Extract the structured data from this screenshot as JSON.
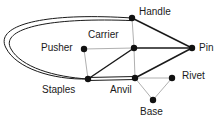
{
  "diagram": {
    "type": "node-link-graph",
    "width": 223,
    "height": 126,
    "background_color": "#ffffff",
    "edge_colors": {
      "strong": "#1a1a1a",
      "weak": "#b0b0b0"
    },
    "node_color": "#111111",
    "node_radius": 3.2,
    "nodes": [
      {
        "id": "handle",
        "label": "Handle",
        "x": 132,
        "y": 18,
        "label_x": 139,
        "label_y": 6,
        "label_anchor": "left"
      },
      {
        "id": "pusher",
        "label": "Pusher",
        "x": 84,
        "y": 49,
        "label_x": 41,
        "label_y": 42,
        "label_anchor": "left"
      },
      {
        "id": "carrier",
        "label": "Carrier",
        "x": 134,
        "y": 48,
        "label_x": 88,
        "label_y": 29,
        "label_anchor": "left"
      },
      {
        "id": "pin",
        "label": "Pin",
        "x": 192,
        "y": 48,
        "label_x": 199,
        "label_y": 42,
        "label_anchor": "left"
      },
      {
        "id": "staples",
        "label": "Staples",
        "x": 88,
        "y": 79,
        "label_x": 42,
        "label_y": 84,
        "label_anchor": "left"
      },
      {
        "id": "anvil",
        "label": "Anvil",
        "x": 135,
        "y": 78,
        "label_x": 110,
        "label_y": 84,
        "label_anchor": "left"
      },
      {
        "id": "rivet",
        "label": "Rivet",
        "x": 172,
        "y": 78,
        "label_x": 182,
        "label_y": 70,
        "label_anchor": "left"
      },
      {
        "id": "base",
        "label": "Base",
        "x": 153,
        "y": 100,
        "label_x": 140,
        "label_y": 106,
        "label_anchor": "left"
      }
    ],
    "edges": [
      {
        "id": "handle-pin",
        "from": "handle",
        "to": "pin",
        "style": "strong",
        "shape": "line"
      },
      {
        "id": "carrier-pin",
        "from": "carrier",
        "to": "pin",
        "style": "strong",
        "shape": "line"
      },
      {
        "id": "anvil-pin",
        "from": "anvil",
        "to": "pin",
        "style": "strong",
        "shape": "line"
      },
      {
        "id": "staples-carrier",
        "from": "staples",
        "to": "carrier",
        "style": "strong",
        "shape": "line"
      },
      {
        "id": "staples-anvil",
        "from": "staples",
        "to": "anvil",
        "style": "strong",
        "shape": "double-line"
      },
      {
        "id": "handle-staples",
        "from": "handle",
        "to": "staples",
        "style": "strong",
        "shape": "double-curve"
      },
      {
        "id": "handle-carrier",
        "from": "handle",
        "to": "carrier",
        "style": "weak",
        "shape": "line"
      },
      {
        "id": "pusher-carrier",
        "from": "pusher",
        "to": "carrier",
        "style": "weak",
        "shape": "line"
      },
      {
        "id": "pusher-staples",
        "from": "pusher",
        "to": "staples",
        "style": "weak",
        "shape": "line"
      },
      {
        "id": "carrier-anvil",
        "from": "carrier",
        "to": "anvil",
        "style": "weak",
        "shape": "line"
      },
      {
        "id": "anvil-rivet",
        "from": "anvil",
        "to": "rivet",
        "style": "weak",
        "shape": "line"
      },
      {
        "id": "anvil-base",
        "from": "anvil",
        "to": "base",
        "style": "weak",
        "shape": "line"
      },
      {
        "id": "rivet-base",
        "from": "rivet",
        "to": "base",
        "style": "weak",
        "shape": "line"
      }
    ]
  }
}
